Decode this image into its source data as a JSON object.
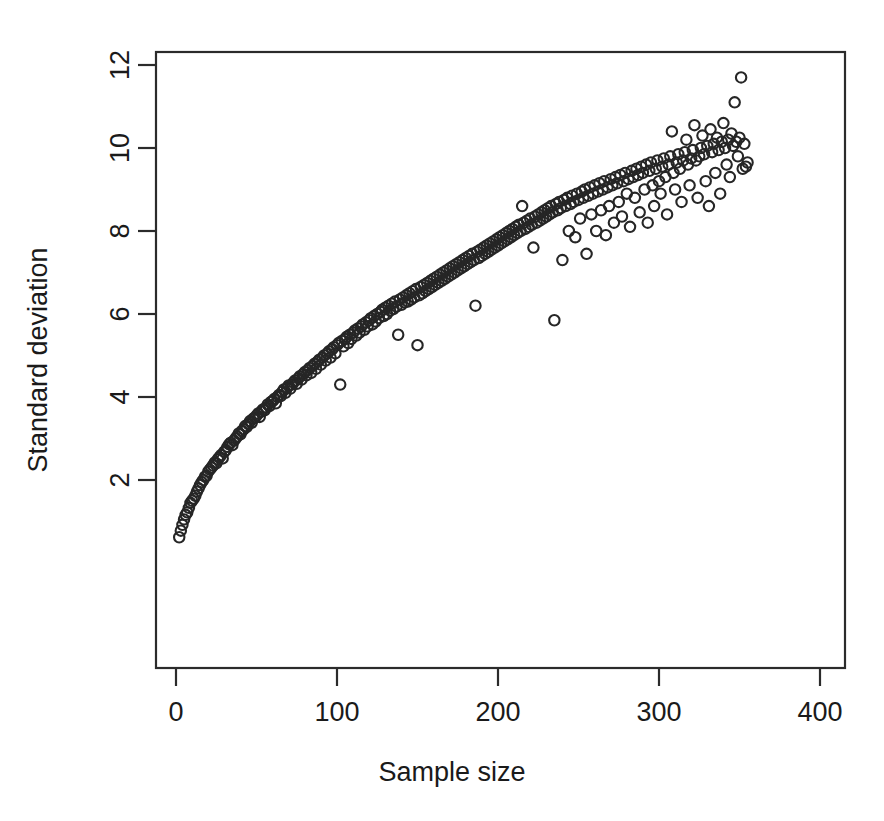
{
  "chart_data": {
    "type": "scatter",
    "title": "",
    "xlabel": "Sample size",
    "ylabel": "Standard deviation",
    "xlim": [
      -8,
      416
    ],
    "ylim": [
      0.15,
      12.55
    ],
    "xticks": [
      0,
      100,
      200,
      300,
      400
    ],
    "xticklabels": [
      "0",
      "100",
      "200",
      "300",
      "400"
    ],
    "yticks": [
      2,
      4,
      6,
      8,
      10,
      12
    ],
    "yticklabels": [
      "2",
      "4",
      "6",
      "8",
      "10",
      "12"
    ],
    "grid": false,
    "legend": null,
    "marker": {
      "shape": "open-circle",
      "radius_px": 5.2,
      "stroke": "#262626",
      "stroke_width_px": 2.1,
      "fill": "none"
    },
    "frame_color": "#2b2b2b",
    "background": "#ffffff",
    "n_points": 400,
    "relationship": "sd increases roughly as 0.52*sqrt(n); vertical scatter widens with n",
    "notes": [
      "Points are open circles (R pch=1 style)",
      "Dense overplotting for small sample sizes along a square-root curve",
      "Spread grows markedly beyond n = 250",
      "Highest value approx sd 11.7 at n approx 399",
      "A low outlier approx sd 5.85 at n approx 249",
      "A high outlier approx sd 8.6 at n approx 219"
    ],
    "x": [
      2,
      3,
      4,
      5,
      6,
      7,
      8,
      9,
      10,
      11,
      12,
      13,
      14,
      15,
      16,
      17,
      18,
      19,
      20,
      21,
      22,
      23,
      24,
      25,
      26,
      27,
      28,
      29,
      30,
      31,
      32,
      33,
      34,
      35,
      36,
      37,
      38,
      39,
      40,
      41,
      42,
      43,
      44,
      45,
      46,
      47,
      48,
      49,
      50,
      51,
      52,
      53,
      54,
      55,
      56,
      57,
      58,
      59,
      60,
      61,
      62,
      63,
      64,
      65,
      66,
      67,
      68,
      69,
      70,
      71,
      72,
      73,
      74,
      75,
      76,
      77,
      78,
      79,
      80,
      81,
      82,
      83,
      84,
      85,
      86,
      87,
      88,
      89,
      90,
      91,
      92,
      93,
      94,
      95,
      96,
      97,
      98,
      99,
      100,
      101,
      102,
      103,
      104,
      105,
      106,
      107,
      108,
      109,
      110,
      111,
      112,
      113,
      114,
      115,
      116,
      117,
      118,
      119,
      120,
      121,
      122,
      123,
      124,
      125,
      126,
      127,
      128,
      129,
      130,
      131,
      132,
      133,
      134,
      135,
      136,
      137,
      138,
      139,
      140,
      141,
      142,
      143,
      144,
      145,
      146,
      147,
      148,
      149,
      150,
      151,
      152,
      153,
      154,
      155,
      156,
      157,
      158,
      159,
      160,
      161,
      162,
      163,
      164,
      165,
      166,
      167,
      168,
      169,
      170,
      171,
      172,
      173,
      174,
      175,
      176,
      177,
      178,
      179,
      180,
      181,
      182,
      183,
      184,
      185,
      186,
      187,
      188,
      189,
      190,
      191,
      192,
      193,
      194,
      195,
      196,
      197,
      198,
      199,
      200,
      201,
      202,
      203,
      204,
      205,
      206,
      207,
      208,
      209,
      210,
      211,
      212,
      213,
      214,
      215,
      216,
      217,
      218,
      219,
      220,
      221,
      222,
      223,
      224,
      225,
      226,
      227,
      228,
      229,
      230,
      231,
      232,
      233,
      234,
      235,
      236,
      237,
      238,
      239,
      240,
      241,
      242,
      243,
      244,
      245,
      246,
      247,
      248,
      249,
      250,
      251,
      252,
      253,
      254,
      255,
      256,
      257,
      258,
      259,
      260,
      261,
      262,
      263,
      264,
      265,
      266,
      267,
      268,
      269,
      270,
      271,
      272,
      273,
      274,
      275,
      276,
      277,
      278,
      279,
      280,
      281,
      282,
      283,
      284,
      285,
      286,
      287,
      288,
      289,
      290,
      291,
      292,
      293,
      294,
      295,
      296,
      297,
      298,
      299,
      300,
      301,
      302,
      303,
      304,
      305,
      306,
      307,
      308,
      309,
      310,
      311,
      312,
      313,
      314,
      315,
      316,
      317,
      318,
      319,
      320,
      321,
      322,
      323,
      324,
      325,
      326,
      327,
      328,
      329,
      330,
      331,
      332,
      333,
      334,
      335,
      336,
      337,
      338,
      339,
      340,
      341,
      342,
      343,
      344,
      345,
      346,
      347,
      348,
      349,
      350,
      351,
      352,
      353,
      354,
      355,
      356,
      357,
      358,
      359,
      360,
      361,
      362,
      363,
      364,
      365,
      366,
      367,
      368,
      369,
      370,
      371,
      372,
      373,
      374,
      375,
      376,
      377,
      378,
      379,
      380,
      381,
      382,
      383,
      384,
      385,
      386,
      387,
      388,
      389,
      390,
      391,
      392,
      393,
      394,
      395,
      396,
      397,
      398,
      399,
      400,
      401
    ],
    "y": [
      0.62,
      0.78,
      0.92,
      1.05,
      1.16,
      1.22,
      1.33,
      1.45,
      1.5,
      1.55,
      1.62,
      1.72,
      1.8,
      1.88,
      1.95,
      2.0,
      2.08,
      2.1,
      2.2,
      2.25,
      2.3,
      2.35,
      2.42,
      2.4,
      2.5,
      2.55,
      2.6,
      2.52,
      2.68,
      2.72,
      2.8,
      2.86,
      2.9,
      2.84,
      2.95,
      3.0,
      3.05,
      3.12,
      3.1,
      3.18,
      3.22,
      3.3,
      3.28,
      3.35,
      3.42,
      3.38,
      3.48,
      3.5,
      3.55,
      3.6,
      3.52,
      3.65,
      3.7,
      3.68,
      3.75,
      3.82,
      3.78,
      3.88,
      3.9,
      3.95,
      3.85,
      4.0,
      4.05,
      4.02,
      4.12,
      4.18,
      4.1,
      4.22,
      4.28,
      4.2,
      4.3,
      4.35,
      4.4,
      4.32,
      4.45,
      4.5,
      4.42,
      4.55,
      4.6,
      4.52,
      4.65,
      4.7,
      4.58,
      4.75,
      4.8,
      4.68,
      4.85,
      4.9,
      4.78,
      4.95,
      5.0,
      4.88,
      5.05,
      5.1,
      4.95,
      5.15,
      5.2,
      5.05,
      5.25,
      5.3,
      4.3,
      5.35,
      5.22,
      5.4,
      5.45,
      5.3,
      5.5,
      5.4,
      5.55,
      5.6,
      5.48,
      5.65,
      5.55,
      5.7,
      5.75,
      5.62,
      5.8,
      5.7,
      5.85,
      5.9,
      5.75,
      5.95,
      5.82,
      6.0,
      5.9,
      6.05,
      6.1,
      5.95,
      6.15,
      6.0,
      6.2,
      6.08,
      6.25,
      6.12,
      6.3,
      6.18,
      5.5,
      6.35,
      6.22,
      6.4,
      6.28,
      6.45,
      6.3,
      6.5,
      6.35,
      6.55,
      6.4,
      6.6,
      5.25,
      6.45,
      6.65,
      6.5,
      6.7,
      6.55,
      6.75,
      6.6,
      6.8,
      6.65,
      6.85,
      6.7,
      6.9,
      6.75,
      6.95,
      6.8,
      7.0,
      6.85,
      7.05,
      6.9,
      7.1,
      6.95,
      7.15,
      7.0,
      7.2,
      7.05,
      7.25,
      7.1,
      7.3,
      7.15,
      7.35,
      7.2,
      7.4,
      7.25,
      7.45,
      7.3,
      6.2,
      7.5,
      7.35,
      7.55,
      7.4,
      7.6,
      7.45,
      7.65,
      7.5,
      7.7,
      7.55,
      7.75,
      7.6,
      7.8,
      7.65,
      7.85,
      7.7,
      7.9,
      7.75,
      7.95,
      7.8,
      8.0,
      7.85,
      8.05,
      7.9,
      8.1,
      7.95,
      8.15,
      8.0,
      8.6,
      8.2,
      8.05,
      8.25,
      8.1,
      8.3,
      8.15,
      7.6,
      8.35,
      8.2,
      8.4,
      8.25,
      8.45,
      8.3,
      8.5,
      8.35,
      8.55,
      8.4,
      8.6,
      8.45,
      5.85,
      8.65,
      8.5,
      8.7,
      8.55,
      7.3,
      8.75,
      8.6,
      8.8,
      8.0,
      8.65,
      8.85,
      8.7,
      7.85,
      8.9,
      8.75,
      8.3,
      8.95,
      8.8,
      9.0,
      7.45,
      8.85,
      9.05,
      8.4,
      8.9,
      9.1,
      8.0,
      8.95,
      9.15,
      8.5,
      9.0,
      9.2,
      7.9,
      9.05,
      8.6,
      9.25,
      9.1,
      8.2,
      9.3,
      9.15,
      8.7,
      9.35,
      8.35,
      9.2,
      9.4,
      8.9,
      9.25,
      8.1,
      9.45,
      9.3,
      8.8,
      9.5,
      9.35,
      8.45,
      9.55,
      9.4,
      9.0,
      9.6,
      8.2,
      9.45,
      9.65,
      9.1,
      8.6,
      9.5,
      9.7,
      9.2,
      8.9,
      9.55,
      9.75,
      9.3,
      8.4,
      9.6,
      9.8,
      10.4,
      9.4,
      9.0,
      9.65,
      9.85,
      9.5,
      8.7,
      9.7,
      9.9,
      10.2,
      9.6,
      9.1,
      9.75,
      9.95,
      10.55,
      9.7,
      8.8,
      9.8,
      10.0,
      10.3,
      9.85,
      9.2,
      10.05,
      8.6,
      10.45,
      9.9,
      10.1,
      9.4,
      10.25,
      9.95,
      8.9,
      10.15,
      10.6,
      10.0,
      9.6,
      10.2,
      9.3,
      10.35,
      10.05,
      11.1,
      10.15,
      9.8,
      10.25,
      11.7,
      9.5,
      10.1,
      9.55,
      9.65
    ]
  }
}
